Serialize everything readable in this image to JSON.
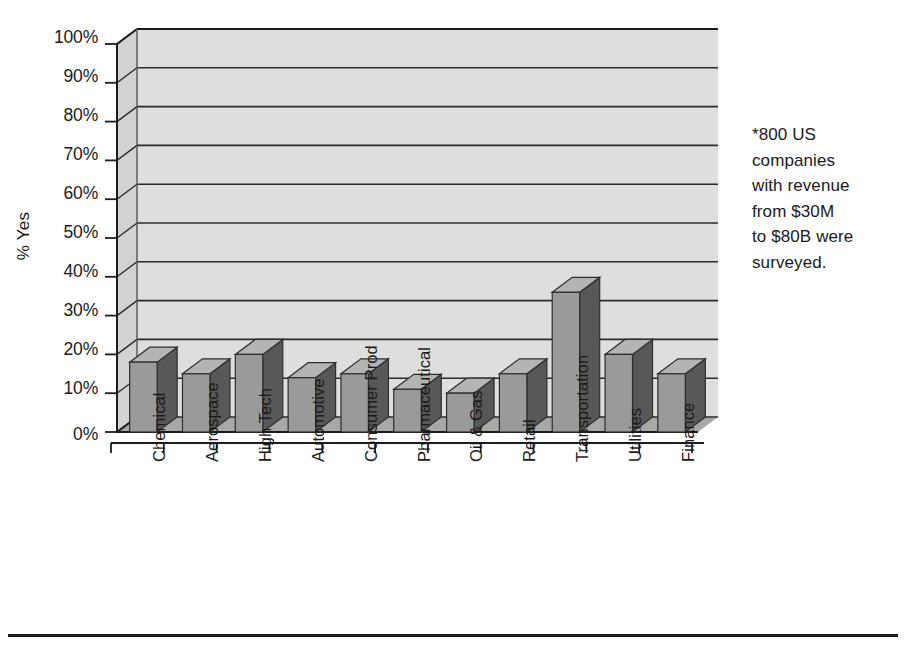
{
  "chart_data": {
    "type": "bar",
    "title": "",
    "subtitle": "",
    "xlabel": "",
    "ylabel": "% Yes",
    "ylim": [
      0,
      100
    ],
    "ytick_labels": [
      "100%",
      "90%",
      "80%",
      "70%",
      "60%",
      "50%",
      "40%",
      "30%",
      "20%",
      "10%",
      "0%"
    ],
    "ytick_values": [
      100,
      90,
      80,
      70,
      60,
      50,
      40,
      30,
      20,
      10,
      0
    ],
    "grid": true,
    "legend": "none",
    "style": "3d-column",
    "units": "percent",
    "categories": [
      "Chemical",
      "Aerospace",
      "High Tech",
      "Automotive",
      "Consumer Prod",
      "Pharmaceutical",
      "Oil & Gas",
      "Retail",
      "Transportation",
      "Utilities",
      "Finance"
    ],
    "values": [
      18,
      15,
      20,
      14,
      15,
      11,
      10,
      15,
      36,
      20,
      15
    ],
    "annotations": [
      "*800 US",
      "companies",
      "with revenue",
      "from $30M",
      "to $80B were",
      "surveyed."
    ]
  },
  "colors": {
    "bar_front": "#9a9a9a",
    "bar_top": "#b4b4b4",
    "bar_side": "#585858",
    "wall_back": "#dededc",
    "wall_left": "#d2d2d0",
    "floor": "#a8a8a6",
    "gridline": "#2b2b2b",
    "axis": "#1c1c1c",
    "text": "#1a1a1a",
    "page_background": "#ffffff"
  }
}
